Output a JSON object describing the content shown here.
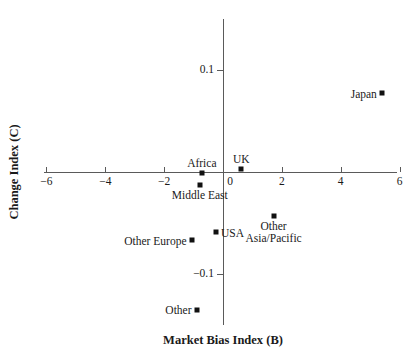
{
  "chart_data": {
    "type": "scatter",
    "title": "",
    "xlabel": "Market Bias Index (B)",
    "ylabel": "Change Index (C)",
    "xlim": [
      -6,
      6
    ],
    "ylim": [
      -0.3,
      0.3
    ],
    "grid": false,
    "legend": "none",
    "xticks": [
      {
        "value": -6,
        "label": "−6"
      },
      {
        "value": -4,
        "label": "−4"
      },
      {
        "value": -2,
        "label": "−2"
      },
      {
        "value": 0,
        "label": "0"
      },
      {
        "value": 2,
        "label": "2"
      },
      {
        "value": 4,
        "label": "4"
      },
      {
        "value": 6,
        "label": "6"
      }
    ],
    "yticks": [
      {
        "value": 0.3,
        "label": "0.3"
      },
      {
        "value": 0.2,
        "label": "0.2"
      },
      {
        "value": 0.1,
        "label": "0.1"
      },
      {
        "value": -0.1,
        "label": "−0.1"
      },
      {
        "value": -0.2,
        "label": "−0.2"
      },
      {
        "value": -0.3,
        "label": "−0.3"
      }
    ],
    "points": [
      {
        "label": "Japan",
        "x": 5.4,
        "y": 0.077,
        "label_pos": "left"
      },
      {
        "label": "UK",
        "x": 0.62,
        "y": 0.003,
        "label_pos": "above"
      },
      {
        "label": "Africa",
        "x": -0.72,
        "y": -0.001,
        "label_pos": "above"
      },
      {
        "label": "Middle East",
        "x": -0.79,
        "y": -0.013,
        "label_pos": "below"
      },
      {
        "label": "USA",
        "x": -0.24,
        "y": -0.059,
        "label_pos": "right"
      },
      {
        "label": "Other Europe",
        "x": -1.07,
        "y": -0.067,
        "label_pos": "left"
      },
      {
        "label": "Other\nAsia/Pacific",
        "x": 1.72,
        "y": -0.043,
        "label_pos": "below"
      },
      {
        "label": "Other",
        "x": -0.9,
        "y": -0.135,
        "label_pos": "left"
      },
      {
        "label": "Germany",
        "x": -1.03,
        "y": -0.214,
        "label_pos": "left"
      },
      {
        "label": "Other",
        "x": -1.03,
        "y": -0.271,
        "label_pos": "left"
      }
    ],
    "quadrants": [
      {
        "label": "I",
        "x": 4.6,
        "y": 0.247
      },
      {
        "label": "II",
        "x": -4.6,
        "y": 0.247
      },
      {
        "label": "III",
        "x": 4.6,
        "y": -0.252
      },
      {
        "label": "IV",
        "x": -4.6,
        "y": -0.252
      }
    ]
  },
  "colors": {
    "marker": "#111111",
    "axis": "#5a5a5a",
    "text": "#1a1a1a",
    "background": "#ffffff"
  }
}
